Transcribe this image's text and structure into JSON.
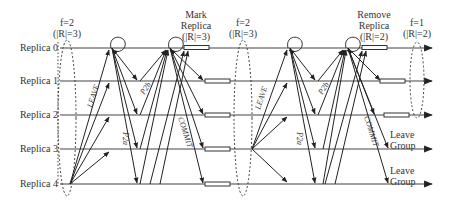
{
  "replicas": [
    {
      "label": "Replica 0",
      "y": 48
    },
    {
      "label": "Replica 1",
      "y": 81
    },
    {
      "label": "Replica 2",
      "y": 115
    },
    {
      "label": "Replica 3",
      "y": 149
    },
    {
      "label": "Replica 4",
      "y": 184
    }
  ],
  "phases": {
    "initial": {
      "line1": "f=2",
      "line2": "(|R|=3)"
    },
    "mark": {
      "line1": "Mark",
      "line2": "Replica",
      "line3": "(|R|=3)"
    },
    "middle": {
      "line1": "f=2",
      "line2": "(|R|=3)"
    },
    "remove": {
      "line1": "Remove",
      "line2": "Replica",
      "line3": "(|R|=2)"
    },
    "final": {
      "line1": "f=1",
      "line2": "(|R|=2)"
    }
  },
  "messages": {
    "leave": "LEAVE",
    "p2a": "P2a",
    "p2b": "P2b",
    "commit": "COMMIT"
  },
  "leave_group": [
    {
      "line1": "Leave",
      "line2": "Group"
    },
    {
      "line1": "Leave",
      "line2": "Group"
    }
  ]
}
